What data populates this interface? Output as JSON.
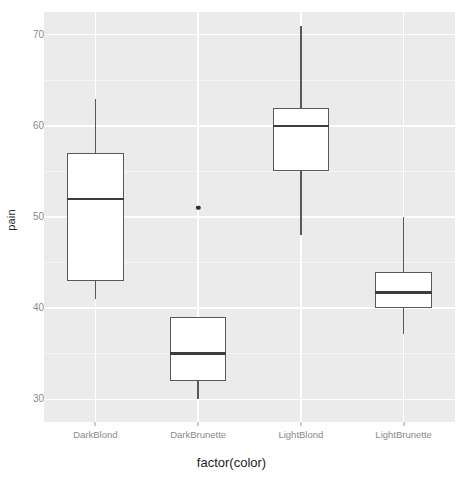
{
  "chart_data": {
    "type": "box",
    "title": "",
    "xlabel": "factor(color)",
    "ylabel": "pain",
    "categories": [
      "DarkBlond",
      "DarkBrunette",
      "LightBlond",
      "LightBrunette"
    ],
    "ylim": [
      27.5,
      72.5
    ],
    "yticks": [
      30,
      40,
      50,
      60,
      70
    ],
    "ytick_labels": [
      "30",
      "40",
      "50",
      "60",
      "70"
    ],
    "yminor_ticks": [
      35,
      45,
      55,
      65
    ],
    "grid": true,
    "legend": "none",
    "boxes": [
      {
        "category": "DarkBlond",
        "whisker_low": 41,
        "q1": 43,
        "median": 52,
        "q3": 57,
        "whisker_high": 63,
        "outliers": []
      },
      {
        "category": "DarkBrunette",
        "whisker_low": 30,
        "q1": 32,
        "median": 35,
        "q3": 39,
        "whisker_high": 39,
        "outliers": [
          51
        ]
      },
      {
        "category": "LightBlond",
        "whisker_low": 48,
        "q1": 55,
        "median": 60,
        "q3": 62,
        "whisker_high": 71,
        "outliers": []
      },
      {
        "category": "LightBrunette",
        "whisker_low": 37.2,
        "q1": 40,
        "median": 41.7,
        "q3": 44,
        "whisker_high": 50,
        "outliers": []
      }
    ]
  },
  "style": {
    "panel_background": "#ebebeb",
    "grid_major_color": "#ffffff",
    "grid_minor_color": "#f5f5f5",
    "box_border_color": "#595959",
    "box_fill_color": "#ffffff",
    "median_color": "#3d3d3d",
    "outlier_color": "#2e2e2e",
    "tick_label_color": "#8a8a8a",
    "axis_title_color": "#1d1d1d"
  }
}
